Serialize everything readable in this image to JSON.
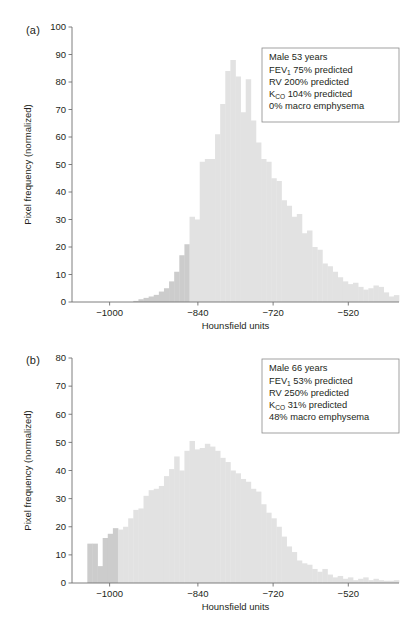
{
  "figure": {
    "panels": [
      {
        "key": "a",
        "label": "(a)",
        "annotation": {
          "lines": [
            {
              "pre": "Male 53 years",
              "sub": "",
              "post": ""
            },
            {
              "pre": "FEV",
              "sub": "1",
              "post": " 75% predicted"
            },
            {
              "pre": "RV 200% predicted",
              "sub": "",
              "post": ""
            },
            {
              "pre": "K",
              "sub": "CO",
              "post": " 104% predicted"
            },
            {
              "pre": "0% macro emphysema",
              "sub": "",
              "post": ""
            }
          ]
        }
      },
      {
        "key": "b",
        "label": "(b)",
        "annotation": {
          "lines": [
            {
              "pre": "Male 66 years",
              "sub": "",
              "post": ""
            },
            {
              "pre": "FEV",
              "sub": "1",
              "post": " 53% predicted"
            },
            {
              "pre": "RV 250% predicted",
              "sub": "",
              "post": ""
            },
            {
              "pre": "K",
              "sub": "CO",
              "post": " 31% predicted"
            },
            {
              "pre": "48% macro emphysema",
              "sub": "",
              "post": ""
            }
          ]
        }
      }
    ]
  },
  "colors": {
    "bar_light": "#e2e2e2",
    "bar_dark": "#cccccc",
    "axis": "#6f6f6f",
    "text": "#231f20",
    "box_border": "#8a8a8a"
  },
  "chart_data": [
    {
      "type": "bar",
      "panel": "a",
      "title": "",
      "xlabel": "Hounsfield units",
      "ylabel": "Pixel frequency (normalized)",
      "ylim": [
        0,
        100
      ],
      "yticks": [
        0,
        10,
        20,
        30,
        40,
        50,
        60,
        70,
        80,
        90,
        100
      ],
      "xtick_labels": [
        "−1000",
        "−840",
        "−720",
        "−520"
      ],
      "xtick_positions": [
        0.115,
        0.385,
        0.615,
        0.845
      ],
      "grid": false,
      "legend": "none",
      "bin_count": 64,
      "dark_bin_end": 23,
      "values": [
        0,
        0,
        0,
        0,
        0,
        0,
        0,
        0,
        0,
        0,
        0,
        0,
        0.4,
        1.0,
        1.5,
        2.0,
        2.6,
        3.8,
        5.0,
        7.5,
        11.0,
        17.0,
        21.0,
        31.0,
        30.0,
        51.0,
        52.0,
        52.0,
        61.0,
        72.0,
        84.0,
        88.0,
        82.0,
        69.0,
        81.0,
        66.0,
        58.0,
        52.0,
        51.0,
        45.0,
        44.0,
        37.0,
        35.0,
        31.0,
        32.0,
        25.0,
        26.0,
        20.0,
        19.0,
        14.0,
        13.0,
        11.0,
        9.0,
        7.5,
        6.5,
        7.0,
        5.5,
        4.5,
        5.0,
        6.0,
        5.5,
        3.5,
        2.0,
        2.5
      ]
    },
    {
      "type": "bar",
      "panel": "b",
      "title": "",
      "xlabel": "Hounsfield units",
      "ylabel": "Pixel frequency (normalized)",
      "ylim": [
        0,
        80
      ],
      "yticks": [
        0,
        10,
        20,
        30,
        40,
        50,
        60,
        70,
        80
      ],
      "xtick_labels": [
        "−1000",
        "−840",
        "−720",
        "−520"
      ],
      "xtick_positions": [
        0.115,
        0.385,
        0.615,
        0.845
      ],
      "grid": false,
      "legend": "none",
      "bin_count": 64,
      "dark_bin_end": 9,
      "values": [
        0,
        0,
        0,
        14.0,
        14.0,
        6.0,
        16.0,
        17.5,
        19.5,
        19.0,
        20.0,
        23.0,
        26.0,
        26.5,
        31.0,
        33.0,
        33.5,
        34.5,
        38.0,
        40.5,
        45.0,
        40.0,
        47.0,
        50.5,
        47.5,
        48.0,
        49.5,
        48.5,
        47.0,
        44.5,
        43.0,
        40.0,
        39.0,
        37.0,
        36.0,
        33.5,
        32.5,
        28.0,
        25.0,
        23.0,
        20.0,
        16.5,
        13.0,
        11.0,
        8.0,
        7.0,
        6.5,
        5.0,
        4.0,
        5.0,
        3.0,
        2.0,
        2.5,
        1.5,
        2.0,
        1.0,
        1.5,
        2.0,
        1.0,
        1.5,
        1.0,
        0.8,
        0.8,
        1.0
      ]
    }
  ]
}
